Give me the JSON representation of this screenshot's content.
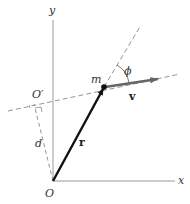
{
  "diagram": {
    "labels": {
      "y_axis": "y",
      "x_axis": "x",
      "origin": "O",
      "origin_prime": "O′",
      "mass": "m",
      "velocity": "v",
      "position": "r",
      "distance": "d",
      "angle": "ϕ"
    },
    "colors": {
      "axis": "#999999",
      "position_vector": "#111111",
      "velocity_vector": "#666666",
      "dashed": "#888888"
    }
  }
}
